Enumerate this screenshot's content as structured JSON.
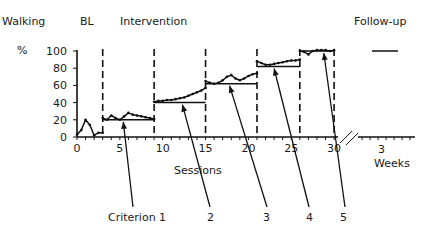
{
  "labels": {
    "behavior": "Walking",
    "baseline": "BL",
    "intervention": "Intervention",
    "followup": "Follow-up",
    "y_unit": "%",
    "x_axis": "Sessions",
    "followup_tick": "3",
    "followup_unit": "Weeks",
    "criteria": [
      "Criterion 1",
      "2",
      "3",
      "4",
      "5"
    ]
  },
  "chart_data": {
    "type": "line",
    "title": "Walking",
    "xlabel": "Sessions",
    "ylabel": "%",
    "ylim": [
      0,
      100
    ],
    "xlim": [
      0,
      30
    ],
    "yticks": [
      0,
      20,
      40,
      60,
      80,
      100
    ],
    "xticks": [
      0,
      5,
      10,
      15,
      20,
      25,
      30
    ],
    "phases": [
      "BL",
      "Intervention",
      "Follow-up"
    ],
    "phase_change_lines": [
      3,
      9,
      15,
      21,
      26,
      30
    ],
    "criterion_levels": [
      {
        "label": "Criterion 1",
        "sessions": [
          3,
          9
        ],
        "value": 20
      },
      {
        "label": "2",
        "sessions": [
          9,
          15
        ],
        "value": 40
      },
      {
        "label": "3",
        "sessions": [
          15,
          21
        ],
        "value": 62
      },
      {
        "label": "4",
        "sessions": [
          21,
          26
        ],
        "value": 82
      },
      {
        "label": "5",
        "sessions": [
          26,
          30
        ],
        "value": 100
      }
    ],
    "series": [
      {
        "name": "Baseline",
        "x": [
          0,
          0.5,
          1,
          1.5,
          2,
          2.5,
          3
        ],
        "values": [
          3,
          8,
          20,
          14,
          2,
          5,
          5
        ]
      },
      {
        "name": "Criterion 1",
        "x": [
          3,
          3.5,
          4,
          4.5,
          5,
          5.5,
          6,
          6.5,
          7,
          7.5,
          8,
          8.5,
          9
        ],
        "values": [
          22,
          20,
          25,
          22,
          20,
          24,
          28,
          26,
          25,
          24,
          23,
          22,
          21
        ]
      },
      {
        "name": "Criterion 2",
        "x": [
          9,
          9.5,
          10,
          10.5,
          11,
          11.5,
          12,
          12.5,
          13,
          13.5,
          14,
          14.5,
          15
        ],
        "values": [
          41,
          42,
          42,
          43,
          43,
          44,
          45,
          46,
          48,
          50,
          52,
          54,
          57
        ]
      },
      {
        "name": "Criterion 3",
        "x": [
          15,
          15.5,
          16,
          16.5,
          17,
          17.5,
          18,
          18.5,
          19,
          19.5,
          20,
          20.5,
          21
        ],
        "values": [
          65,
          63,
          62,
          63,
          66,
          70,
          72,
          68,
          66,
          68,
          71,
          73,
          74
        ]
      },
      {
        "name": "Criterion 4",
        "x": [
          21,
          21.5,
          22,
          22.5,
          23,
          23.5,
          24,
          24.5,
          25,
          25.5,
          26
        ],
        "values": [
          88,
          86,
          84,
          84,
          85,
          86,
          87,
          88,
          89,
          89,
          90
        ]
      },
      {
        "name": "Criterion 5",
        "x": [
          26,
          26.5,
          27,
          27.5,
          28,
          28.5,
          29,
          29.5,
          30
        ],
        "values": [
          100,
          99,
          96,
          100,
          101,
          101,
          101,
          100,
          101
        ]
      },
      {
        "name": "Follow-up",
        "x": [
          "3 Weeks"
        ],
        "values": [
          100
        ]
      }
    ]
  }
}
